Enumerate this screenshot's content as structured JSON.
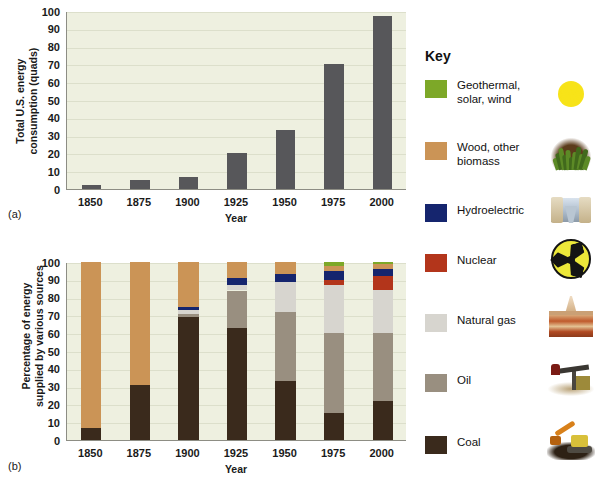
{
  "figure": {
    "panel_a_letter": "(a)",
    "panel_b_letter": "(b)"
  },
  "key": {
    "title": "Key",
    "entries": [
      {
        "label": "Geothermal,\nsolar, wind",
        "label_line1": "Geothermal,",
        "label_line2": "solar, wind",
        "color": "#7da828",
        "icon": "sun-icon"
      },
      {
        "label": "Wood, other\nbiomass",
        "label_line1": "Wood, other",
        "label_line2": "biomass",
        "color": "#cb9456",
        "icon": "plant-biomass-icon"
      },
      {
        "label": "Hydroelectric",
        "label_line1": "Hydroelectric",
        "label_line2": "",
        "color": "#15256e",
        "icon": "dam-icon"
      },
      {
        "label": "Nuclear",
        "label_line1": "Nuclear",
        "label_line2": "",
        "color": "#b3351b",
        "icon": "radiation-icon"
      },
      {
        "label": "Natural gas",
        "label_line1": "Natural gas",
        "label_line2": "",
        "color": "#d7d5cf",
        "icon": "gas-rig-icon"
      },
      {
        "label": "Oil",
        "label_line1": "Oil",
        "label_line2": "",
        "color": "#998f80",
        "icon": "oil-pump-icon"
      },
      {
        "label": "Coal",
        "label_line1": "Coal",
        "label_line2": "",
        "color": "#3a2a1c",
        "icon": "coal-dozer-icon"
      }
    ]
  },
  "chart_data": [
    {
      "id": "panel-a",
      "type": "bar",
      "title": "",
      "xlabel": "Year",
      "ylabel": "Total U.S. energy consumption (quads)",
      "ylabel_line1": "Total U.S. energy",
      "ylabel_line2": "consumption (quads)",
      "categories": [
        "1850",
        "1875",
        "1900",
        "1925",
        "1950",
        "1975",
        "2000"
      ],
      "values": [
        2,
        5,
        7,
        20,
        33,
        70,
        97
      ],
      "ylim": [
        0,
        100
      ],
      "yticks": [
        0,
        10,
        20,
        30,
        40,
        50,
        60,
        70,
        80,
        90,
        100
      ],
      "bar_color": "#57575a",
      "grid": true,
      "legend": "none"
    },
    {
      "id": "panel-b",
      "type": "bar",
      "stacked": true,
      "title": "",
      "xlabel": "Year",
      "ylabel": "Percentage of energy supplied by various sources",
      "ylabel_line1": "Percentage of energy",
      "ylabel_line2": "supplied by various sources",
      "categories": [
        "1850",
        "1875",
        "1900",
        "1925",
        "1950",
        "1975",
        "2000"
      ],
      "ylim": [
        0,
        100
      ],
      "yticks": [
        0,
        10,
        20,
        30,
        40,
        50,
        60,
        70,
        80,
        90,
        100
      ],
      "grid": true,
      "legend": "right",
      "series": [
        {
          "name": "Coal",
          "color": "#3a2a1c",
          "values": [
            7,
            31,
            69,
            63,
            33,
            15,
            22
          ]
        },
        {
          "name": "Oil",
          "color": "#998f80",
          "values": [
            0,
            0,
            2,
            21,
            39,
            45,
            38
          ]
        },
        {
          "name": "Natural gas",
          "color": "#d7d5cf",
          "values": [
            0,
            0,
            2,
            3,
            17,
            27,
            24
          ]
        },
        {
          "name": "Nuclear",
          "color": "#b3351b",
          "values": [
            0,
            0,
            0,
            0,
            0,
            3,
            8
          ]
        },
        {
          "name": "Hydroelectric",
          "color": "#15256e",
          "values": [
            0,
            0,
            2,
            4,
            4,
            5,
            4
          ]
        },
        {
          "name": "Wood, other biomass",
          "color": "#cb9456",
          "values": [
            93,
            69,
            25,
            9,
            7,
            3,
            3
          ]
        },
        {
          "name": "Geothermal, solar, wind",
          "color": "#7da828",
          "values": [
            0,
            0,
            0,
            0,
            0,
            2,
            1
          ]
        }
      ]
    }
  ]
}
